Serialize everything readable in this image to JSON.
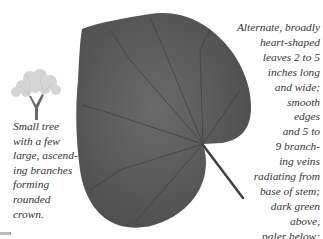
{
  "illustration": {
    "tree_icon": "small-tree-silhouette",
    "leaf_icon": "heart-shaped-leaf",
    "leaf_color": "#5a5a5a",
    "petiole_color": "#3f3f3f"
  },
  "captions": {
    "tree": {
      "lines": [
        "Small tree",
        "with a few",
        "large, ascend-",
        "ing branches",
        "forming",
        "rounded",
        "crown."
      ]
    },
    "leaf": {
      "lines": [
        "Alternate, broadly",
        "heart-shaped",
        "leaves 2 to 5",
        "inches long",
        "and wide;",
        "smooth",
        "edges",
        "and 5 to",
        "9 branch-",
        "ing veins",
        "radiating from",
        "base of stem;",
        "dark green",
        "above,",
        "paler below;",
        "yellow in fall."
      ]
    }
  }
}
